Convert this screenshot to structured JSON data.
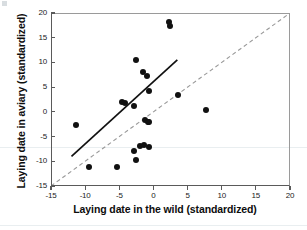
{
  "chart_data": {
    "type": "scatter",
    "title": "",
    "xlabel": "Laying date in the wild (standardized)",
    "ylabel": "Laying date in aviary (standardized)",
    "xlim": [
      -15,
      20
    ],
    "ylim": [
      -15,
      20
    ],
    "xticks": [
      -15,
      -10,
      -5,
      0,
      5,
      10,
      15,
      20
    ],
    "yticks": [
      -15,
      -10,
      -5,
      0,
      5,
      10,
      15,
      20
    ],
    "xticklabels": [
      "-15",
      "-10",
      "-5",
      "0",
      "5",
      "10",
      "15",
      "20"
    ],
    "yticklabels": [
      "-15",
      "-10",
      "-5",
      "0",
      "5",
      "10",
      "15",
      "20"
    ],
    "grid": false,
    "legend": null,
    "points": [
      {
        "x": 2.3,
        "y": 18.1
      },
      {
        "x": 2.4,
        "y": 17.3
      },
      {
        "x": -2.6,
        "y": 10.4
      },
      {
        "x": -1.6,
        "y": 8.1
      },
      {
        "x": -0.9,
        "y": 7.2
      },
      {
        "x": -0.6,
        "y": 4.2
      },
      {
        "x": 3.6,
        "y": 3.4
      },
      {
        "x": -4.6,
        "y": 2.0
      },
      {
        "x": -4.2,
        "y": 1.8
      },
      {
        "x": -2.9,
        "y": 1.1
      },
      {
        "x": 7.7,
        "y": 0.4
      },
      {
        "x": -1.2,
        "y": -1.6
      },
      {
        "x": -0.8,
        "y": -2.0
      },
      {
        "x": -0.6,
        "y": -2.1
      },
      {
        "x": -11.4,
        "y": -2.7
      },
      {
        "x": -1.9,
        "y": -6.9
      },
      {
        "x": -1.4,
        "y": -6.8
      },
      {
        "x": -0.6,
        "y": -7.1
      },
      {
        "x": -2.9,
        "y": -8.0
      },
      {
        "x": -2.6,
        "y": -9.8
      },
      {
        "x": -9.5,
        "y": -11.1
      },
      {
        "x": -5.4,
        "y": -11.1
      }
    ],
    "lines": [
      {
        "name": "regression-line",
        "style": "solid",
        "color": "#111111",
        "x0": -12.0,
        "y0": -9.0,
        "x1": 3.5,
        "y1": 10.5
      },
      {
        "name": "identity-line",
        "style": "dashed",
        "color": "#999999",
        "x0": -15.0,
        "y0": -15.0,
        "x1": 20.0,
        "y1": 20.0
      }
    ]
  }
}
